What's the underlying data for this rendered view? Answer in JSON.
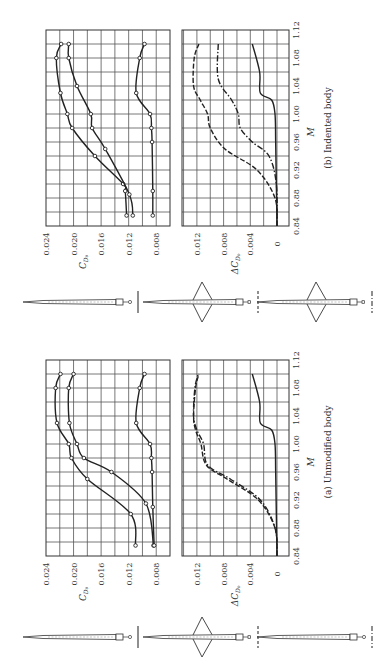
{
  "figure": {
    "orientation": "rotated 90 degrees counter-clockwise",
    "panels": [
      {
        "id": "b",
        "caption": "(b)  Indented body"
      },
      {
        "id": "a",
        "caption": "(a)  Unmodified body"
      }
    ],
    "x_axis_label": "M",
    "y_axis_label_top": "C_D0",
    "y_axis_label_bottom": "ΔC_D0",
    "m_ticks": [
      "0.84",
      "0.88",
      "0.92",
      "0.96",
      "1.00",
      "1.04",
      "1.08",
      "1.12"
    ],
    "cd_ticks": [
      "0.024",
      "0.020",
      "0.016",
      "0.012",
      "0.008"
    ],
    "dcd_ticks": [
      "0.012",
      "0.008",
      "0.004",
      "0"
    ],
    "configurations": [
      {
        "name": "body-alone",
        "legend_line": "solid"
      },
      {
        "name": "body-with-wing",
        "legend_line": "dashed"
      },
      {
        "name": "body-with-wing-and-tail",
        "legend_line": "dash-dot"
      }
    ]
  },
  "chart_data": [
    {
      "type": "line",
      "title": "(b) Indented body",
      "xlabel": "M",
      "ylabel": "C_D0",
      "xlim": [
        0.84,
        1.12
      ],
      "ylim": [
        0.006,
        0.024
      ],
      "grid": true,
      "series": [
        {
          "name": "Body + wing + tail (C_D0)",
          "line": "solid",
          "markers": true,
          "x": [
            0.855,
            0.89,
            0.9,
            0.94,
            0.98,
            1.0,
            1.03,
            1.08,
            1.1
          ],
          "y": [
            0.0123,
            0.0125,
            0.0128,
            0.0169,
            0.0202,
            0.0209,
            0.0219,
            0.0225,
            0.0218
          ]
        },
        {
          "name": "Body + wing (C_D0)",
          "line": "solid",
          "markers": true,
          "x": [
            0.855,
            0.885,
            0.95,
            0.98,
            1.0,
            1.04,
            1.08,
            1.1
          ],
          "y": [
            0.0114,
            0.0119,
            0.0154,
            0.0173,
            0.0175,
            0.0195,
            0.0207,
            0.0207
          ]
        },
        {
          "name": "Body alone (C_D0)",
          "line": "solid",
          "markers": true,
          "x": [
            0.855,
            0.89,
            0.96,
            0.98,
            1.0,
            1.03,
            1.08,
            1.1
          ],
          "y": [
            0.0085,
            0.0085,
            0.0086,
            0.0087,
            0.0089,
            0.0109,
            0.0104,
            0.0097
          ]
        }
      ]
    },
    {
      "type": "line",
      "title": "(b) Indented body",
      "xlabel": "M",
      "ylabel": "ΔC_D0",
      "xlim": [
        0.84,
        1.12
      ],
      "ylim": [
        -0.0005,
        0.0145
      ],
      "grid": true,
      "series": [
        {
          "name": "Body alone",
          "line": "solid",
          "x": [
            0.84,
            0.9,
            0.96,
            1.0,
            1.02,
            1.03,
            1.06,
            1.1
          ],
          "y": [
            0,
            0.0001,
            0.0002,
            0.0003,
            0.0008,
            0.0025,
            0.0026,
            0.0037
          ]
        },
        {
          "name": "Wing-body",
          "line": "dash-dot",
          "x": [
            0.84,
            0.9,
            0.94,
            0.96,
            0.98,
            1.0,
            1.02,
            1.05,
            1.1
          ],
          "y": [
            0,
            0.0001,
            0.0012,
            0.0037,
            0.0055,
            0.0058,
            0.0068,
            0.0088,
            0.0088
          ]
        },
        {
          "name": "Wing-body-tail",
          "line": "dashed",
          "x": [
            0.84,
            0.88,
            0.92,
            0.95,
            0.98,
            1.0,
            1.02,
            1.04,
            1.08,
            1.1
          ],
          "y": [
            0,
            0.0003,
            0.003,
            0.0078,
            0.01,
            0.0104,
            0.0115,
            0.0125,
            0.0124,
            0.0117
          ]
        }
      ]
    },
    {
      "type": "line",
      "title": "(a) Unmodified body",
      "xlabel": "M",
      "ylabel": "C_D0",
      "xlim": [
        0.84,
        1.12
      ],
      "ylim": [
        0.006,
        0.024
      ],
      "grid": true,
      "series": [
        {
          "name": "Body + wing + tail (C_D0)",
          "line": "solid",
          "markers": true,
          "x": [
            0.855,
            0.9,
            0.95,
            0.98,
            1.0,
            1.03,
            1.08,
            1.1
          ],
          "y": [
            0.011,
            0.0117,
            0.018,
            0.0203,
            0.0207,
            0.0224,
            0.0226,
            0.0219
          ]
        },
        {
          "name": "Body + wing (C_D0)",
          "line": "solid",
          "markers": true,
          "x": [
            0.855,
            0.915,
            0.96,
            0.98,
            1.0,
            1.03,
            1.08,
            1.1
          ],
          "y": [
            0.0084,
            0.0095,
            0.0145,
            0.0185,
            0.0195,
            0.0206,
            0.0207,
            0.02
          ]
        },
        {
          "name": "Body alone (C_D0)",
          "line": "solid",
          "markers": true,
          "x": [
            0.855,
            0.91,
            0.96,
            0.98,
            1.0,
            1.03,
            1.08,
            1.1
          ],
          "y": [
            0.0083,
            0.0085,
            0.0086,
            0.0087,
            0.0089,
            0.0109,
            0.0104,
            0.0097
          ]
        }
      ]
    },
    {
      "type": "line",
      "title": "(a) Unmodified body",
      "xlabel": "M",
      "ylabel": "ΔC_D0",
      "xlim": [
        0.84,
        1.12
      ],
      "ylim": [
        -0.0005,
        0.0145
      ],
      "grid": true,
      "series": [
        {
          "name": "Body alone",
          "line": "solid",
          "x": [
            0.84,
            0.9,
            0.96,
            1.0,
            1.02,
            1.03,
            1.06,
            1.1
          ],
          "y": [
            0,
            0.0001,
            0.0002,
            0.0003,
            0.0008,
            0.0025,
            0.0026,
            0.0037
          ]
        },
        {
          "name": "Wing-body",
          "line": "dash-dot",
          "x": [
            0.84,
            0.88,
            0.92,
            0.95,
            0.97,
            1.0,
            1.02,
            1.04,
            1.08,
            1.1
          ],
          "y": [
            0,
            0.0003,
            0.0025,
            0.007,
            0.0104,
            0.011,
            0.012,
            0.0125,
            0.0123,
            0.0118
          ]
        },
        {
          "name": "Wing-body-tail",
          "line": "dashed",
          "x": [
            0.84,
            0.88,
            0.92,
            0.95,
            0.97,
            1.0,
            1.02,
            1.04,
            1.08,
            1.1
          ],
          "y": [
            0,
            0.0003,
            0.0028,
            0.0075,
            0.0106,
            0.0114,
            0.0122,
            0.0125,
            0.0122,
            0.0117
          ]
        }
      ]
    }
  ]
}
